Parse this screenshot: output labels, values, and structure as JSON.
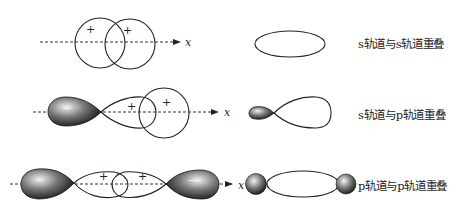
{
  "diagram": {
    "axis_label": "x",
    "sign_plus": "+",
    "sign_minus": "−",
    "colors": {
      "stroke": "#222222",
      "axis": "#333333",
      "lobe_dark": "#111111",
      "lobe_mid": "#7a7a7a",
      "lobe_light": "#e8e8e8",
      "background": "#ffffff"
    },
    "rows": [
      {
        "id": "s-s",
        "label": "s轨道与s轨道重叠",
        "before": "two s orbitals (circles) overlapping on x-axis",
        "after": "single ellipse (sigma bond)"
      },
      {
        "id": "s-p",
        "label": "s轨道与p轨道重叠",
        "before": "p orbital (negative dark lobe, positive lobe) overlapping with s orbital",
        "after": "small dark lobe + large lobe"
      },
      {
        "id": "p-p",
        "label": "p轨道与p轨道重叠",
        "before": "two p orbitals overlapping head-to-head",
        "after": "ellipse with two small dark spheres at ends"
      }
    ]
  }
}
